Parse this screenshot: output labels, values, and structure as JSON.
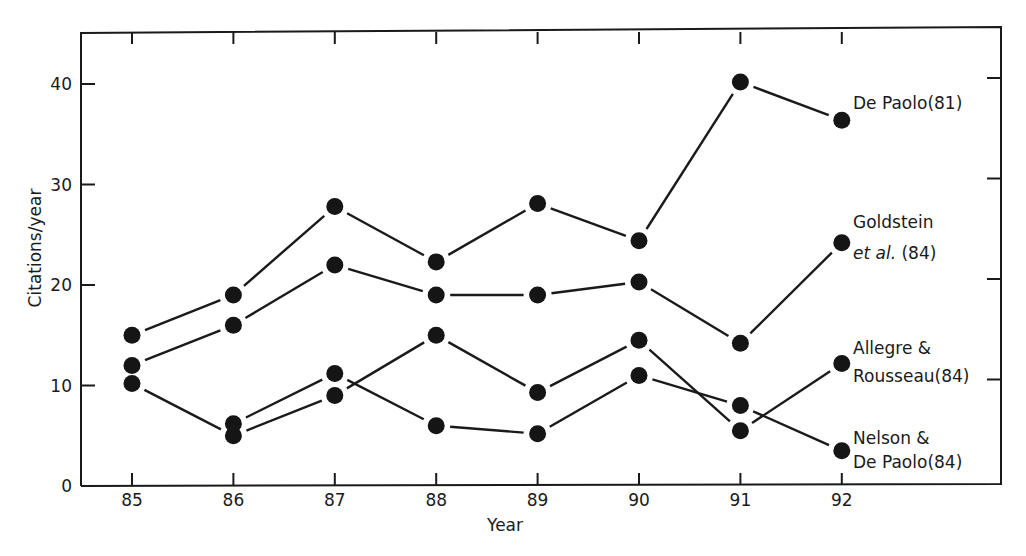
{
  "chart_data": {
    "type": "line",
    "title": "",
    "xlabel": "Year",
    "ylabel": "Citations/year",
    "x": [
      85,
      86,
      87,
      88,
      89,
      90,
      91,
      92
    ],
    "x_tick_labels": [
      "85",
      "86",
      "87",
      "88",
      "89",
      "90",
      "91",
      "92"
    ],
    "y_tick_labels": [
      "0",
      "10",
      "20",
      "30",
      "40"
    ],
    "y_ticks": [
      0,
      10,
      20,
      30,
      40
    ],
    "xlim": [
      83.5,
      93.6
    ],
    "ylim": [
      0,
      45
    ],
    "grid": false,
    "legend_position": "inline-right",
    "marker": "filled-circle",
    "series": [
      {
        "name": "De Paolo (81)",
        "label_lines": [
          "De Paolo(81)"
        ],
        "x": [
          85,
          86,
          87,
          88,
          89,
          90,
          91,
          92
        ],
        "values": [
          15,
          19,
          27.8,
          22.3,
          28.1,
          24.4,
          40.2,
          36.4
        ]
      },
      {
        "name": "Goldstein et al. (84)",
        "label_lines": [
          "Goldstein",
          "et al. (84)"
        ],
        "label_italic_part": "et al.",
        "x": [
          85,
          86,
          87,
          88,
          89,
          90,
          91,
          92
        ],
        "values": [
          12,
          16,
          22,
          19,
          19,
          20.3,
          14.2,
          24.2
        ]
      },
      {
        "name": "Allegre & Rousseau (84)",
        "label_lines": [
          "Allegre &",
          "Rousseau(84)"
        ],
        "x": [
          85,
          86,
          87,
          88,
          89,
          90,
          91,
          92
        ],
        "values": [
          10.2,
          5,
          9,
          15,
          9.3,
          14.5,
          5.5,
          12.2
        ]
      },
      {
        "name": "Nelson & De Paolo (84)",
        "label_lines": [
          "Nelson &",
          "De Paolo(84)"
        ],
        "x": [
          86,
          87,
          88,
          89,
          90,
          91,
          92
        ],
        "values": [
          6.2,
          11.2,
          6,
          5.2,
          11,
          8,
          3.5
        ]
      }
    ]
  }
}
